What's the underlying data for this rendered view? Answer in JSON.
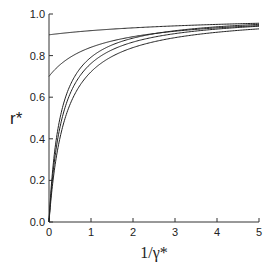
{
  "chart_data": {
    "type": "line",
    "title": "",
    "xlabel": "1/γ*",
    "ylabel": "r*",
    "xlim": [
      0,
      5
    ],
    "ylim": [
      0.0,
      1.0
    ],
    "grid": false,
    "legend": null,
    "x_ticks": [
      0,
      1,
      2,
      3,
      4,
      5
    ],
    "x_tick_labels": [
      "0",
      "1",
      "2",
      "3",
      "4",
      "5"
    ],
    "y_ticks": [
      0.0,
      0.2,
      0.4,
      0.6,
      0.8,
      1.0
    ],
    "y_tick_labels": [
      "0.0",
      "0.2",
      "0.4",
      "0.6",
      "0.8",
      "1.0"
    ],
    "x": [
      0,
      0.25,
      0.5,
      1,
      1.5,
      2,
      3,
      4,
      5
    ],
    "series": [
      {
        "name": "curve-1",
        "values": [
          0.9,
          0.906,
          0.911,
          0.92,
          0.927,
          0.933,
          0.943,
          0.95,
          0.955
        ]
      },
      {
        "name": "curve-2",
        "values": [
          0.7,
          0.754,
          0.791,
          0.84,
          0.87,
          0.891,
          0.917,
          0.933,
          0.944
        ]
      },
      {
        "name": "curve-3",
        "values": [
          0.0,
          0.487,
          0.655,
          0.792,
          0.851,
          0.884,
          0.919,
          0.938,
          0.95
        ]
      },
      {
        "name": "curve-4",
        "values": [
          0.0,
          0.444,
          0.615,
          0.762,
          0.828,
          0.865,
          0.906,
          0.928,
          0.941
        ]
      },
      {
        "name": "curve-5",
        "values": [
          0.0,
          0.394,
          0.565,
          0.722,
          0.796,
          0.839,
          0.886,
          0.912,
          0.929
        ]
      }
    ]
  }
}
